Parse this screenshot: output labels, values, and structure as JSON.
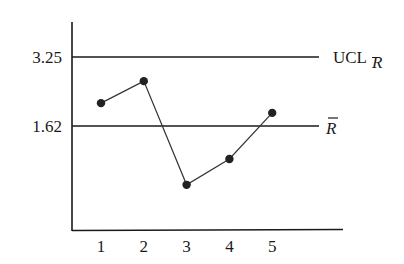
{
  "chart_data": {
    "type": "line",
    "title": "",
    "xlabel": "",
    "ylabel": "",
    "categories": [
      "1",
      "2",
      "3",
      "4",
      "5"
    ],
    "series": [
      {
        "name": "R",
        "values": [
          2.16,
          2.68,
          0.23,
          0.84,
          1.93
        ]
      }
    ],
    "reference_lines": [
      {
        "name": "UCL_R",
        "label_main": "UCL",
        "label_sub": "R",
        "value": 3.25
      },
      {
        "name": "R_bar",
        "label_main": "R",
        "value": 1.62
      }
    ],
    "y_tick_labels": [
      "3.25",
      "1.62"
    ],
    "x_tick_labels": [
      "1",
      "2",
      "3",
      "4",
      "5"
    ],
    "ylim": [
      -0.84,
      4.1
    ],
    "grid": false,
    "legend": "none"
  },
  "colors": {
    "ink": "#1a1a1a",
    "background": "#ffffff"
  }
}
